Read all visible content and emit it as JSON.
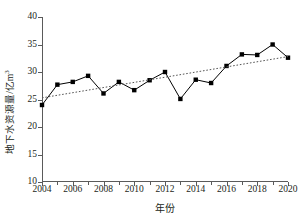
{
  "chart_data": {
    "type": "line",
    "title": "",
    "xlabel": "年份",
    "ylabel": "地下水资源量/亿m³",
    "ylabel_base": "地下水资源量/亿m",
    "ylabel_sup": "3",
    "xlim": [
      2004,
      2020
    ],
    "ylim": [
      10,
      40
    ],
    "yticks": [
      10,
      15,
      20,
      25,
      30,
      35,
      40
    ],
    "ytick_labels": [
      "10",
      "15",
      "20",
      "25",
      "30",
      "35",
      "40"
    ],
    "xticks": [
      2004,
      2006,
      2008,
      2010,
      2012,
      2014,
      2016,
      2018,
      2020
    ],
    "xtick_labels": [
      "2004",
      "2006",
      "2008",
      "2010",
      "2012",
      "2014",
      "2016",
      "2018",
      "2020"
    ],
    "x_minor_ticks": [
      2005,
      2007,
      2009,
      2011,
      2013,
      2015,
      2017,
      2019
    ],
    "grid": false,
    "legend": "none",
    "marker": "filled-square",
    "series": [
      {
        "name": "地下水资源量",
        "style": "solid-line-with-square-markers",
        "color": "#000000",
        "x": [
          2004,
          2005,
          2006,
          2007,
          2008,
          2009,
          2010,
          2011,
          2012,
          2013,
          2014,
          2015,
          2016,
          2017,
          2018,
          2019,
          2020
        ],
        "values": [
          24.0,
          27.7,
          28.2,
          29.3,
          26.1,
          28.2,
          26.7,
          28.5,
          30.0,
          25.1,
          28.6,
          28.0,
          31.1,
          33.2,
          33.1,
          35.0,
          32.6
        ]
      },
      {
        "name": "线性趋势线",
        "style": "dotted-trend-line",
        "color": "#555555",
        "x": [
          2004,
          2020
        ],
        "values": [
          25.3,
          32.8
        ]
      }
    ]
  }
}
